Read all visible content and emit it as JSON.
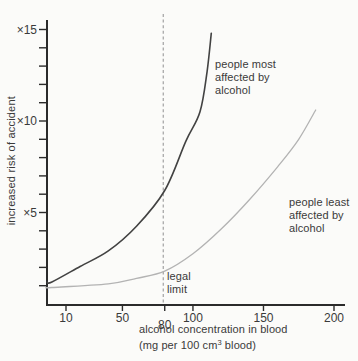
{
  "figure": {
    "y_axis_title": "increased risk of accident",
    "x_axis_title_line1": "alcohol concentration in blood",
    "x_axis_title_line2_pre": "(mg per 100 cm",
    "x_axis_title_sup": "3",
    "x_axis_title_line2_post": " blood)"
  },
  "annotations": {
    "most": {
      "lines": [
        "people most",
        "affected by",
        "alcohol"
      ]
    },
    "least": {
      "lines": [
        "people least",
        "affected by",
        "alcohol"
      ]
    },
    "legal": {
      "lines": [
        "legal",
        "limit"
      ]
    }
  },
  "colors": {
    "background": "#fbfbf9",
    "axis": "#2b2b2b",
    "text": "#3a3a3a",
    "curve_most": "#424242",
    "curve_least": "#b3b3b3",
    "dashed_line": "#9a9a9a"
  },
  "chart_data": {
    "type": "line",
    "title": "",
    "xlabel": "alcohol concentration in blood (mg per 100 cm³ blood)",
    "ylabel": "increased risk of accident",
    "xlim": [
      0,
      210
    ],
    "ylim": [
      0,
      15.5
    ],
    "grid": false,
    "legend_position": "inline-annotations",
    "x_ticks": [
      {
        "value": 10,
        "label": "10",
        "dy": 0
      },
      {
        "value": 50,
        "label": "50",
        "dy": 0
      },
      {
        "value": 80,
        "label": "80",
        "dy": 6.5
      },
      {
        "value": 100,
        "label": "100",
        "dy": 0
      },
      {
        "value": 150,
        "label": "150",
        "dy": 0
      },
      {
        "value": 200,
        "label": "200",
        "dy": 0
      }
    ],
    "y_ticks": {
      "minor_step": 1,
      "min": 1,
      "max": 15,
      "labeled": [
        {
          "value": 15,
          "label": "×15"
        },
        {
          "value": 10,
          "label": "×10"
        },
        {
          "value": 5,
          "label": "×5"
        }
      ]
    },
    "legal_limit": {
      "value": 80,
      "label": "legal limit"
    },
    "series": [
      {
        "name": "people most affected by alcohol",
        "color": "#424242",
        "points": [
          [
            0,
            1.2
          ],
          [
            20,
            2.05
          ],
          [
            40,
            2.9
          ],
          [
            60,
            4.25
          ],
          [
            80,
            6.2
          ],
          [
            95,
            8.9
          ],
          [
            105,
            10.5
          ],
          [
            110,
            12.7
          ],
          [
            113,
            14.8
          ]
        ]
      },
      {
        "name": "people least affected by alcohol",
        "color": "#b3b3b3",
        "points": [
          [
            0,
            0.9
          ],
          [
            40,
            1.1
          ],
          [
            60,
            1.4
          ],
          [
            80,
            1.8
          ],
          [
            100,
            2.75
          ],
          [
            120,
            4.1
          ],
          [
            140,
            5.7
          ],
          [
            160,
            7.5
          ],
          [
            175,
            9.0
          ],
          [
            187,
            10.6
          ]
        ]
      }
    ]
  }
}
